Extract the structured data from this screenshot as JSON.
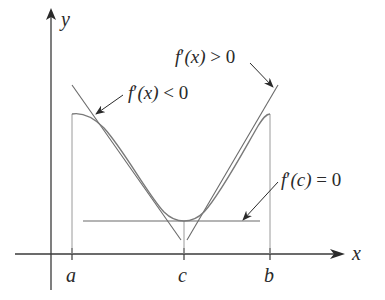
{
  "diagram": {
    "title": "",
    "axes": {
      "x_label": "x",
      "y_label": "y"
    },
    "ticks": {
      "a": "a",
      "c": "c",
      "b": "b"
    },
    "annotations": {
      "decreasing": {
        "f": "f",
        "prime": "′",
        "arg": "(x)",
        "rel": " < 0"
      },
      "increasing": {
        "f": "f",
        "prime": "′",
        "arg": "(x)",
        "rel": " > 0"
      },
      "critical": {
        "f": "f",
        "prime": "′",
        "arg": "(c)",
        "rel": " = 0"
      }
    },
    "colors": {
      "axis": "#3a3a3a",
      "curve": "#7a7a7a",
      "tangent": "#8a8a8a",
      "text": "#2a2a2a"
    }
  }
}
